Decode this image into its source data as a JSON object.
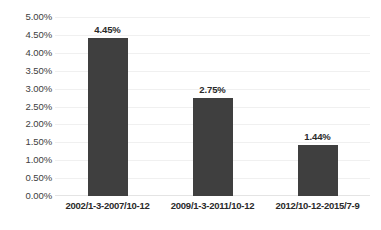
{
  "chart_data": {
    "type": "bar",
    "title": "",
    "subtitle": "",
    "xlabel": "",
    "ylabel": "",
    "categories": [
      "2002/1-3-2007/10-12",
      "2009/1-3-2011/10-12",
      "2012/10-12-2015/7-9"
    ],
    "values": [
      4.45,
      2.75,
      1.44
    ],
    "value_labels": [
      "4.45%",
      "2.75%",
      "1.44%"
    ],
    "ylim": [
      0,
      5
    ],
    "ytick_step": 0.5,
    "ytick_labels": [
      "5.00%",
      "4.50%",
      "4.00%",
      "3.50%",
      "3.00%",
      "2.50%",
      "2.00%",
      "1.50%",
      "1.00%",
      "0.50%",
      "0.00%"
    ],
    "ytick_values": [
      5.0,
      4.5,
      4.0,
      3.5,
      3.0,
      2.5,
      2.0,
      1.5,
      1.0,
      0.5,
      0.0
    ],
    "unit": "%",
    "grid": "horizontal",
    "legend": "none",
    "legend_entries": [],
    "annotations": [],
    "colors": {
      "bar": "#3f3f3f",
      "gridline": "#f0f0f0",
      "baseline": "#e4e4e4",
      "tick_text": "#404040",
      "label_text": "#2a2a2a",
      "background": "#ffffff"
    }
  }
}
